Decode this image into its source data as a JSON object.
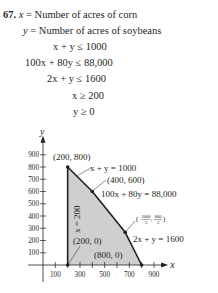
{
  "problem": {
    "number": "67.",
    "definitions": [
      {
        "var": "x",
        "text": " = Number of acres of corn"
      },
      {
        "var": "y",
        "text": " = Number of acres of soybeans"
      }
    ],
    "constraints": [
      "x + y ≤ 1000",
      "100x + 80y ≤ 88,000",
      "2x + y ≤ 1600",
      "x ≥ 200",
      "y ≥ 0"
    ]
  },
  "chart_data": {
    "type": "area",
    "title": "",
    "xlabel": "x",
    "ylabel": "y",
    "xlim": [
      0,
      950
    ],
    "ylim": [
      0,
      950
    ],
    "xticks": [
      100,
      200,
      300,
      400,
      500,
      600,
      700,
      800,
      900
    ],
    "xtick_labels": [
      "100",
      "300",
      "500",
      "700",
      "900"
    ],
    "xtick_label_values": [
      100,
      300,
      500,
      700,
      900
    ],
    "yticks": [
      100,
      200,
      300,
      400,
      500,
      600,
      700,
      800,
      900
    ],
    "ytick_labels": [
      "100",
      "200",
      "300",
      "400",
      "500",
      "600",
      "700",
      "800",
      "900"
    ],
    "grid": false,
    "feasible_region": [
      [
        200,
        0
      ],
      [
        200,
        800
      ],
      [
        400,
        600
      ],
      [
        666.67,
        266.67
      ],
      [
        800,
        0
      ]
    ],
    "fill_color": "#cfcfd0",
    "vertices": [
      {
        "x": 200,
        "y": 800,
        "label": "(200, 800)"
      },
      {
        "x": 400,
        "y": 600,
        "label": "(400, 600)"
      },
      {
        "x": 666.67,
        "y": 266.67,
        "label": "(2000/3, 800/3)"
      },
      {
        "x": 200,
        "y": 0,
        "label": "(200, 0)"
      },
      {
        "x": 800,
        "y": 0,
        "label": "(800, 0)"
      }
    ],
    "boundary_labels": [
      {
        "text": "x + y = 1000"
      },
      {
        "text": "100x + 80y = 88,000"
      },
      {
        "text": "2x + y = 1600"
      },
      {
        "text": "x = 200"
      }
    ]
  }
}
